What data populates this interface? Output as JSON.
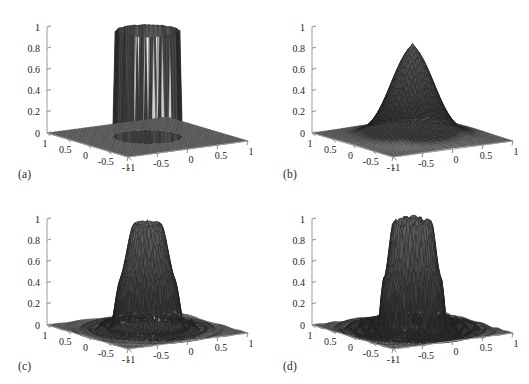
{
  "figure": {
    "background_color": "#ffffff",
    "ink_color": "#1a1a1a",
    "panel_count": 4,
    "layout": "2x2 grid of 3D mesh surface plots"
  },
  "panels": [
    {
      "id": "a",
      "caption": "(a)",
      "description": "sharp-edged cylindrical plateau, ideal low-pass cutoff, vertical side walls",
      "surface_style": "sharp-cylinder"
    },
    {
      "id": "b",
      "caption": "(b)",
      "description": "smooth tapered dome plateau, no ripples, gradual skirt",
      "surface_style": "smooth-dome"
    },
    {
      "id": "c",
      "caption": "(c)",
      "description": "plateau with moderate concentric Gibbs ripples on the base plane",
      "surface_style": "ripple-moderate"
    },
    {
      "id": "d",
      "caption": "(d)",
      "description": "plateau with stronger higher-frequency concentric ripples on the base plane",
      "surface_style": "ripple-strong"
    }
  ],
  "chart_data": [
    {
      "type": "surface",
      "panel": "a",
      "title": "",
      "xlabel": "",
      "ylabel": "",
      "zlabel": "",
      "x_ticks": [
        -1,
        -0.5,
        0,
        0.5,
        1
      ],
      "x_tick_labels": [
        "-1",
        "-0.5",
        "0",
        "0.5",
        "1"
      ],
      "y_ticks": [
        1,
        0.5,
        0,
        -0.5,
        -1
      ],
      "y_tick_labels": [
        "1",
        "0.5",
        "0",
        "-0.5",
        "-1"
      ],
      "z_ticks": [
        0,
        0.2,
        0.4,
        0.6,
        0.8,
        1
      ],
      "z_tick_labels": [
        "0",
        "0.2",
        "0.4",
        "0.6",
        "0.8",
        "1"
      ],
      "xlim": [
        -1,
        1
      ],
      "ylim": [
        -1,
        1
      ],
      "zlim": [
        0,
        1
      ],
      "grid": false,
      "legend": "none",
      "plateau_height": 1.0,
      "plateau_radius": 0.45,
      "edge_softness": 0.02,
      "ripple_amplitude": 0.0,
      "ripple_frequency": 0
    },
    {
      "type": "surface",
      "panel": "b",
      "title": "",
      "xlabel": "",
      "ylabel": "",
      "zlabel": "",
      "x_ticks": [
        -1,
        -0.5,
        0,
        0.5,
        1
      ],
      "x_tick_labels": [
        "-1",
        "-0.5",
        "0",
        "0.5",
        "1"
      ],
      "y_ticks": [
        1,
        0.5,
        0,
        -0.5,
        -1
      ],
      "y_tick_labels": [
        "1",
        "0.5",
        "0",
        "-0.5",
        "-1"
      ],
      "z_ticks": [
        0,
        0.2,
        0.4,
        0.6,
        0.8,
        1
      ],
      "z_tick_labels": [
        "0",
        "0.2",
        "0.4",
        "0.6",
        "0.8",
        "1"
      ],
      "xlim": [
        -1,
        1
      ],
      "ylim": [
        -1,
        1
      ],
      "zlim": [
        0,
        1
      ],
      "grid": false,
      "legend": "none",
      "plateau_height": 1.0,
      "plateau_radius": 0.3,
      "edge_softness": 0.3,
      "ripple_amplitude": 0.0,
      "ripple_frequency": 0
    },
    {
      "type": "surface",
      "panel": "c",
      "title": "",
      "xlabel": "",
      "ylabel": "",
      "zlabel": "",
      "x_ticks": [
        -1,
        -0.5,
        0,
        0.5,
        1
      ],
      "x_tick_labels": [
        "-1",
        "-0.5",
        "0",
        "0.5",
        "1"
      ],
      "y_ticks": [
        1,
        0.5,
        0,
        -0.5,
        -1
      ],
      "y_tick_labels": [
        "1",
        "0.5",
        "0",
        "-0.5",
        "-1"
      ],
      "z_ticks": [
        0,
        0.2,
        0.4,
        0.6,
        0.8,
        1
      ],
      "z_tick_labels": [
        "0",
        "0.2",
        "0.4",
        "0.6",
        "0.8",
        "1"
      ],
      "xlim": [
        -1,
        1
      ],
      "ylim": [
        -1,
        1
      ],
      "zlim": [
        0,
        1
      ],
      "grid": false,
      "legend": "none",
      "plateau_height": 1.0,
      "plateau_radius": 0.36,
      "edge_softness": 0.12,
      "ripple_amplitude": 0.14,
      "ripple_frequency": 9
    },
    {
      "type": "surface",
      "panel": "d",
      "title": "",
      "xlabel": "",
      "ylabel": "",
      "zlabel": "",
      "x_ticks": [
        -1,
        -0.5,
        0,
        0.5,
        1
      ],
      "x_tick_labels": [
        "-1",
        "-0.5",
        "0",
        "0.5",
        "1"
      ],
      "y_ticks": [
        1,
        0.5,
        0,
        -0.5,
        -1
      ],
      "y_tick_labels": [
        "1",
        "0.5",
        "0",
        "-0.5",
        "-1"
      ],
      "z_ticks": [
        0,
        0.2,
        0.4,
        0.6,
        0.8,
        1
      ],
      "z_tick_labels": [
        "0",
        "0.2",
        "0.4",
        "0.6",
        "0.8",
        "1"
      ],
      "xlim": [
        -1,
        1
      ],
      "ylim": [
        -1,
        1
      ],
      "zlim": [
        0,
        1
      ],
      "grid": false,
      "legend": "none",
      "plateau_height": 1.0,
      "plateau_radius": 0.38,
      "edge_softness": 0.08,
      "ripple_amplitude": 0.2,
      "ripple_frequency": 13
    }
  ]
}
